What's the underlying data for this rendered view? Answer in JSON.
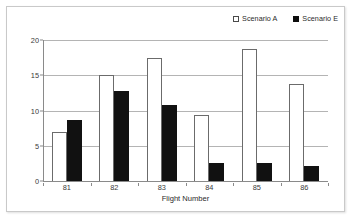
{
  "chart_data": {
    "type": "bar",
    "title": "",
    "subtitle": "",
    "xlabel": "Flight Number",
    "ylabel": "",
    "categories": [
      "81",
      "82",
      "83",
      "84",
      "85",
      "86"
    ],
    "series": [
      {
        "name": "Scenario A",
        "swatch": "hollow",
        "color": "#ffffff",
        "border_color": "#6b6b6b",
        "values": [
          7.0,
          15.0,
          17.4,
          9.4,
          18.7,
          13.8
        ]
      },
      {
        "name": "Scenario E",
        "swatch": "solid",
        "color": "#111111",
        "border_color": "#111111",
        "values": [
          8.7,
          12.8,
          10.8,
          2.5,
          2.5,
          2.1
        ]
      }
    ],
    "ylim": [
      0,
      20
    ],
    "yticks": [
      0,
      5,
      10,
      15,
      20
    ],
    "ytick_labels": [
      "0",
      "5",
      "10",
      "15",
      "20"
    ],
    "grid": true,
    "grid_axis": "y",
    "legend_position": "top-right",
    "gridline_color": "#b4b4b4",
    "axis_color": "#8a8a8a",
    "frame_border_color": "#c9c9c9",
    "background": "#ffffff"
  }
}
